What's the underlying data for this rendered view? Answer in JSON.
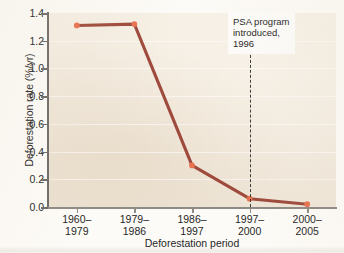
{
  "chart_data": {
    "type": "line",
    "title": "",
    "xlabel": "Deforestation period",
    "ylabel": "Deforestation rate (%/yr)",
    "categories": [
      "1960–\n1979",
      "1979–\n1986",
      "1986–\n1997",
      "1997–\n2000",
      "2000–\n2005"
    ],
    "category_lines": [
      [
        "1960–",
        "1979"
      ],
      [
        "1979–",
        "1986"
      ],
      [
        "1986–",
        "1997"
      ],
      [
        "1997–",
        "2000"
      ],
      [
        "2000–",
        "2005"
      ]
    ],
    "values": [
      1.31,
      1.32,
      0.3,
      0.06,
      0.02
    ],
    "ylim": [
      0.0,
      1.4
    ],
    "ytick_labels": [
      "0.0",
      "0.2",
      "0.4",
      "0.6",
      "0.8",
      "1.0",
      "1.2",
      "1.4"
    ],
    "ytick_values": [
      0.0,
      0.2,
      0.4,
      0.6,
      0.8,
      1.0,
      1.2,
      1.4
    ],
    "grid": false,
    "legend": false,
    "line_color": "#9e4a3c",
    "marker_color": "#e8714f",
    "plot_background": "#f3ebdf",
    "annotations": [
      {
        "lines": [
          "PSA program",
          "introduced,",
          "1996"
        ],
        "x_category_index": 3,
        "rule_style": "dashed",
        "rule_color": "#3a3a3a"
      }
    ]
  }
}
